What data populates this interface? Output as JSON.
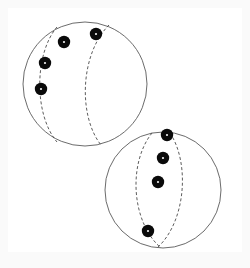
{
  "figure": {
    "background_color": "#fafafa",
    "canvas_color": "#ffffff",
    "outline_color": "#5a5a5a",
    "dashed_color": "#4a4a4a",
    "marker_color": "#0a0a0a",
    "marker_highlight_color": "#f2f2f2",
    "canvas": {
      "x": 8,
      "y": 8,
      "width": 234,
      "height": 244
    }
  },
  "spheres": [
    {
      "id": "sphere-upper-left",
      "label": "upper-left-sphere",
      "cx": 85,
      "cy": 84,
      "r": 62,
      "arcs": [
        {
          "id": "arc-upper-left-1",
          "label": "left-meridian",
          "path": "M 57 27 C 34 54 34 115 57 142",
          "style": "dashed"
        },
        {
          "id": "arc-upper-left-2",
          "label": "right-meridian",
          "path": "M 109 25 C 80 54 78 116 101 145",
          "style": "dashed"
        }
      ],
      "markers": [
        {
          "id": "dot-ul-1",
          "label": "marker-1",
          "cx": 96,
          "cy": 34,
          "r": 6.2
        },
        {
          "id": "dot-ul-2",
          "label": "marker-2",
          "cx": 64,
          "cy": 42,
          "r": 6.2
        },
        {
          "id": "dot-ul-3",
          "label": "marker-3",
          "cx": 45,
          "cy": 63,
          "r": 6.2
        },
        {
          "id": "dot-ul-4",
          "label": "marker-4",
          "cx": 41,
          "cy": 89,
          "r": 6.2
        }
      ]
    },
    {
      "id": "sphere-lower-right",
      "label": "lower-right-sphere",
      "cx": 163,
      "cy": 190,
      "r": 58,
      "arcs": [
        {
          "id": "arc-lower-right-1",
          "label": "left-meridian",
          "path": "M 152 133 C 128 163 131 222 161 248",
          "style": "dashed"
        },
        {
          "id": "arc-lower-right-2",
          "label": "right-meridian",
          "path": "M 170 133 C 190 163 186 222 157 248",
          "style": "dashed"
        }
      ],
      "markers": [
        {
          "id": "dot-lr-1",
          "label": "marker-1",
          "cx": 167,
          "cy": 135,
          "r": 6.2
        },
        {
          "id": "dot-lr-2",
          "label": "marker-2",
          "cx": 163,
          "cy": 158,
          "r": 6.2
        },
        {
          "id": "dot-lr-3",
          "label": "marker-3",
          "cx": 158,
          "cy": 182,
          "r": 6.2
        },
        {
          "id": "dot-lr-4",
          "label": "marker-4",
          "cx": 148,
          "cy": 231,
          "r": 6.2
        }
      ]
    }
  ]
}
